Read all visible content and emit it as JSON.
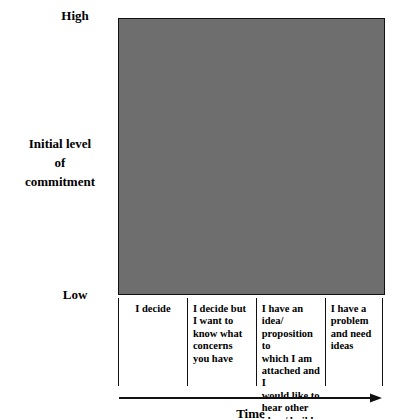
{
  "chart_data": {
    "type": "diagram",
    "title": "",
    "ylabel": "Initial level\nof\ncommitment",
    "xlabel": "Time",
    "y_ticks": [
      "High",
      "Low"
    ],
    "axis_range_note": "Initial level of commitment rises from Low at bottom to High at top; Time increases left to right",
    "grid": false,
    "legend": "none",
    "diagonal": "line from bottom-left to top-right of plot",
    "steps": [
      {
        "index": 1,
        "column": "I decide",
        "fill": "#ffffff",
        "width_pct": 26,
        "height_pct": 24
      },
      {
        "index": 2,
        "column": "I decide but I want to know what concerns you have",
        "fill": "#e9e9e9",
        "width_pct": 52,
        "height_pct": 48
      },
      {
        "index": 3,
        "column": "I have an idea/ proposition to which I am attached and I would like to hear other ideas/ builds",
        "fill": "#c2c2c2",
        "width_pct": 78,
        "height_pct": 72
      },
      {
        "index": 4,
        "column": "I have a problem and need ideas",
        "fill": "#6e6e6e",
        "width_pct": 100,
        "height_pct": 100
      }
    ],
    "zones": [
      {
        "label": "Best\ncurrent\nthinking",
        "color": "#ffffff"
      },
      {
        "label": "Creative\nproblem\nsolving",
        "color": "#ffffff"
      }
    ],
    "columns": [
      "I decide",
      "I decide but\nI want to\nknow what\nconcerns\nyou have",
      "I have an idea/\nproposition to\nwhich I am\nattached and I\nwould like to\nhear other\nideas/ builds",
      "I have a\nproblem\nand need\nideas"
    ]
  },
  "axis": {
    "high": "High",
    "low": "Low",
    "y_title": "Initial level\nof\ncommitment",
    "x_title": "Time"
  },
  "zones": {
    "best": "Best\ncurrent\nthinking",
    "creative": "Creative\nproblem\nsolving"
  },
  "colors": {
    "step1": "#ffffff",
    "step2": "#e9e9e9",
    "step3": "#c2c2c2",
    "step4": "#6e6e6e",
    "outline": "#111111",
    "text": "#000000",
    "zone_text": "#ffffff"
  }
}
